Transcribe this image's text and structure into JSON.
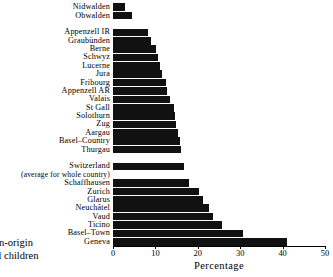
{
  "side_caption": {
    "line1": "foreign-origin",
    "line2": "school children"
  },
  "axis": {
    "x_title": "Percentage",
    "ticks": [
      "0",
      "10",
      "20",
      "30",
      "40",
      "50"
    ],
    "tick_values": [
      0,
      10,
      20,
      30,
      40,
      50
    ],
    "xmin": 0,
    "xmax": 50
  },
  "colors": {
    "bar": "#111111",
    "axis": "#000000",
    "background": "#ffffff"
  },
  "chart_data": {
    "type": "bar",
    "orientation": "horizontal",
    "title": "",
    "subtitle": "",
    "xlabel": "Percentage",
    "ylabel": "foreign-origin school children",
    "xlim": [
      0,
      50
    ],
    "grid": false,
    "legend": null,
    "categories": [
      "Nidwalden",
      "Obwalden",
      "",
      "Appenzell IR",
      "Graubünden",
      "Berne",
      "Schwyz",
      "Lucerne",
      "Jura",
      "Fribourg",
      "Appenzell AR",
      "Valais",
      "St Gall",
      "Solothurn",
      "Zug",
      "Aargau",
      "Basel–Country",
      "Thurgau",
      "",
      "Switzerland",
      "(average for whole country)",
      "Schaffhausen",
      "Zurich",
      "Glarus",
      "Neuchâtel",
      "Vaud",
      "Ticino",
      "Basel–Town",
      "Geneva"
    ],
    "values": [
      2.8,
      4.4,
      null,
      8.3,
      9.0,
      10.2,
      10.6,
      11.0,
      11.5,
      12.4,
      12.8,
      13.4,
      14.3,
      14.6,
      14.9,
      15.3,
      15.7,
      16.0,
      null,
      16.8,
      null,
      18.0,
      20.4,
      21.2,
      22.6,
      23.5,
      25.6,
      30.6,
      41.0
    ],
    "rows": [
      {
        "label": "Nidwalden",
        "value": 2.8,
        "bar": true
      },
      {
        "label": "Obwalden",
        "value": 4.4,
        "bar": true
      },
      {
        "label": "",
        "value": null,
        "bar": false
      },
      {
        "label": "Appenzell IR",
        "value": 8.3,
        "bar": true
      },
      {
        "label": "Graubünden",
        "value": 9.0,
        "bar": true
      },
      {
        "label": "Berne",
        "value": 10.2,
        "bar": true
      },
      {
        "label": "Schwyz",
        "value": 10.6,
        "bar": true
      },
      {
        "label": "Lucerne",
        "value": 11.0,
        "bar": true
      },
      {
        "label": "Jura",
        "value": 11.5,
        "bar": true
      },
      {
        "label": "Fribourg",
        "value": 12.4,
        "bar": true
      },
      {
        "label": "Appenzell AR",
        "value": 12.8,
        "bar": true
      },
      {
        "label": "Valais",
        "value": 13.4,
        "bar": true
      },
      {
        "label": "St Gall",
        "value": 14.3,
        "bar": true
      },
      {
        "label": "Solothurn",
        "value": 14.6,
        "bar": true
      },
      {
        "label": "Zug",
        "value": 14.9,
        "bar": true
      },
      {
        "label": "Aargau",
        "value": 15.3,
        "bar": true
      },
      {
        "label": "Basel–Country",
        "value": 15.7,
        "bar": true
      },
      {
        "label": "Thurgau",
        "value": 16.0,
        "bar": true
      },
      {
        "label": "",
        "value": null,
        "bar": false
      },
      {
        "label": "Switzerland",
        "value": 16.8,
        "bar": true
      },
      {
        "label": "(average for whole country)",
        "value": null,
        "bar": false
      },
      {
        "label": "Schaffhausen",
        "value": 18.0,
        "bar": true
      },
      {
        "label": "Zurich",
        "value": 20.4,
        "bar": true
      },
      {
        "label": "Glarus",
        "value": 21.2,
        "bar": true
      },
      {
        "label": "Neuchâtel",
        "value": 22.6,
        "bar": true
      },
      {
        "label": "Vaud",
        "value": 23.5,
        "bar": true
      },
      {
        "label": "Ticino",
        "value": 25.6,
        "bar": true
      },
      {
        "label": "Basel–Town",
        "value": 30.6,
        "bar": true
      },
      {
        "label": "Geneva",
        "value": 41.0,
        "bar": true
      }
    ]
  }
}
